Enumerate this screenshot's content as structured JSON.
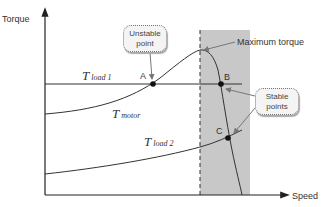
{
  "diagram": {
    "axes": {
      "y_label": "Torque",
      "x_label": "Speed"
    },
    "curves": {
      "load1": {
        "symbol": "T",
        "subscript": "load 1"
      },
      "motor": {
        "symbol": "T",
        "subscript": "motor"
      },
      "load2": {
        "symbol": "T",
        "subscript": "load 2"
      }
    },
    "points": {
      "a": "A",
      "b": "B",
      "c": "C"
    },
    "annotations": {
      "unstable_line1": "Unstable",
      "unstable_line2": "point",
      "stable_line1": "Stable",
      "stable_line2": "points",
      "max_torque": "Maximum torque"
    },
    "colors": {
      "shaded_region": "#c8c8c8",
      "curve": "#333333",
      "callout_bg": "#f4f4f4"
    }
  }
}
